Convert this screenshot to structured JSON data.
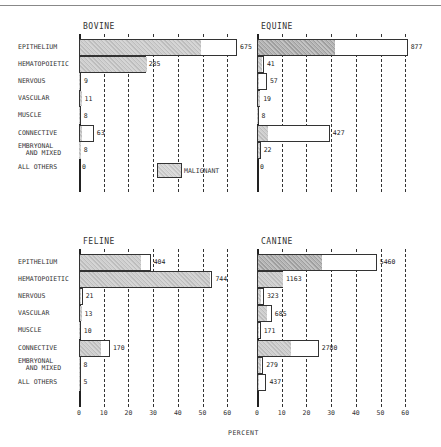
{
  "chart_data": {
    "type": "bar",
    "orientation": "horizontal",
    "layout": "2x2 small multiples",
    "xlabel": "PERCENT",
    "xlim": [
      0,
      60
    ],
    "xticks": [
      0,
      10,
      20,
      30,
      40,
      50,
      60
    ],
    "grid": "vertical dashed at each tick",
    "legend": {
      "label": "MALIGNANT",
      "description": "shaded portion of bar = malignant; unshaded remainder = benign",
      "position": "inside Bovine panel, lower right"
    },
    "categories": [
      "EPITHELIUM",
      "HEMATOPOIETIC",
      "NERVOUS",
      "VASCULAR",
      "MUSCLE",
      "CONNECTIVE",
      "EMBRYONAL AND MIXED",
      "ALL OTHERS"
    ],
    "panels": [
      {
        "title": "BOVINE",
        "counts": [
          675,
          285,
          9,
          11,
          8,
          63,
          8,
          0
        ],
        "total_percent": [
          64,
          27,
          0.8,
          1,
          0.7,
          6,
          0.7,
          0
        ],
        "malignant_percent": [
          49,
          27,
          0.3,
          1,
          0.5,
          1,
          0.7,
          0
        ]
      },
      {
        "title": "EQUINE",
        "counts": [
          877,
          41,
          57,
          19,
          8,
          427,
          22,
          0
        ],
        "total_percent": [
          61,
          2.8,
          4,
          1.3,
          0.5,
          29.5,
          1.5,
          0
        ],
        "malignant_percent": [
          31,
          1.5,
          0.5,
          0.8,
          0.3,
          4,
          1,
          0
        ]
      },
      {
        "title": "FELINE",
        "counts": [
          404,
          744,
          21,
          13,
          10,
          170,
          8,
          5
        ],
        "total_percent": [
          29,
          54,
          1.5,
          1,
          0.7,
          12.5,
          0.6,
          0.4
        ],
        "malignant_percent": [
          24.5,
          52.5,
          0.5,
          0.8,
          0.4,
          8.5,
          0.4,
          0.3
        ]
      },
      {
        "title": "CANINE",
        "counts": [
          5460,
          1163,
          323,
          685,
          171,
          2780,
          279,
          437
        ],
        "total_percent": [
          48.5,
          10.5,
          2.8,
          6,
          1.5,
          25,
          2.5,
          3.8
        ],
        "malignant_percent": [
          26,
          10,
          1.2,
          3.5,
          0.5,
          13.5,
          1.2,
          0.3
        ]
      }
    ]
  },
  "labels": {
    "rows": [
      "EPITHELIUM",
      "HEMATOPOIETIC",
      "NERVOUS",
      "VASCULAR",
      "MUSCLE",
      "CONNECTIVE",
      "EMBRYONAL\n  AND MIXED",
      "ALL OTHERS"
    ],
    "ticks": [
      "0",
      "10",
      "20",
      "30",
      "40",
      "50",
      "60"
    ],
    "xlabel": "PERCENT",
    "legend": "MALIGNANT"
  }
}
